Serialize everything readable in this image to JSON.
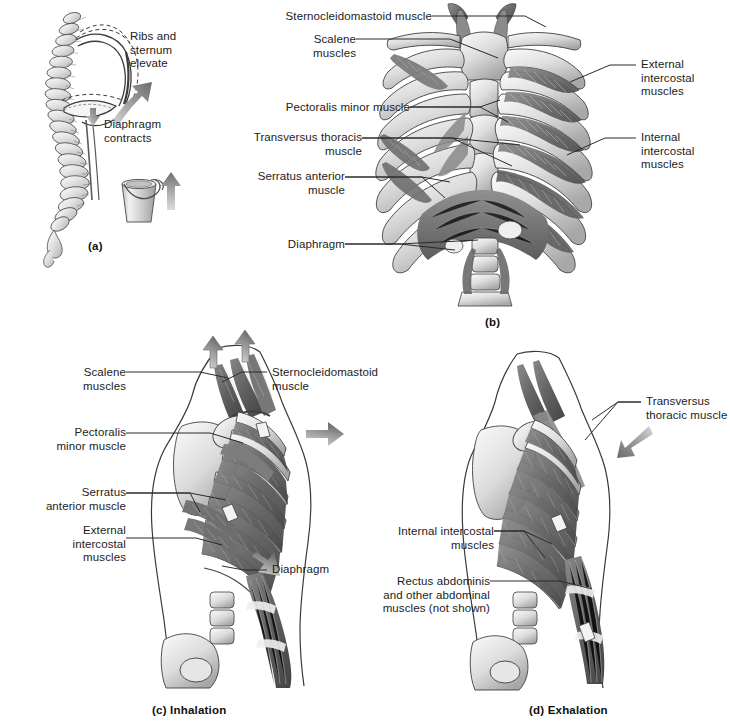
{
  "figure": {
    "background_color": "#ffffff",
    "ink_color": "#1c1c1c",
    "leader_color": "#2a2a2a",
    "arrow_color": "#8a8a8a"
  },
  "panels": [
    {
      "id": "a",
      "caption": "(a)",
      "caption_x": 88,
      "caption_y": 240,
      "subject": "lateral view of vertebral column and rib cage with bucket-handle analogy",
      "labels": [
        {
          "name": "ribs-and-sternum-elevate",
          "text": "Ribs and\nsternum\nelevate",
          "x": 130,
          "y": 30,
          "align": "left"
        },
        {
          "name": "diaphragm-contracts",
          "text": "Diaphragm\ncontracts",
          "x": 104,
          "y": 118,
          "align": "left"
        }
      ],
      "arrows": [
        {
          "name": "elevate-arrow",
          "direction": "up-right"
        },
        {
          "name": "contract-arrow",
          "direction": "down"
        },
        {
          "name": "bucket-handle-arrow",
          "direction": "up"
        }
      ]
    },
    {
      "id": "b",
      "caption": "(b)",
      "caption_x": 485,
      "caption_y": 316,
      "subject": "anterior view of thoracic cage with respiratory muscles",
      "labels": [
        {
          "name": "sternocleidomastoid-muscle",
          "text": "Sternocleidomastoid muscle",
          "x": 268,
          "y": 10,
          "align": "right"
        },
        {
          "name": "scalene-muscles",
          "text": "Scalene muscles",
          "x": 268,
          "y": 33,
          "align": "right"
        },
        {
          "name": "pectoralis-minor-muscle",
          "text": "Pectoralis minor muscle",
          "x": 238,
          "y": 101,
          "align": "right"
        },
        {
          "name": "transversus-thoracis-muscle",
          "text": "Transversus thoracis\nmuscle",
          "x": 238,
          "y": 131,
          "align": "right"
        },
        {
          "name": "serratus-anterior-muscle",
          "text": "Serratus anterior\nmuscle",
          "x": 238,
          "y": 170,
          "align": "right"
        },
        {
          "name": "diaphragm",
          "text": "Diaphragm",
          "x": 238,
          "y": 238,
          "align": "right"
        },
        {
          "name": "external-intercostal-muscles",
          "text": "External\nintercostal\nmuscles",
          "x": 641,
          "y": 58,
          "align": "left"
        },
        {
          "name": "internal-intercostal-muscles",
          "text": "Internal\nintercostal\nmuscles",
          "x": 641,
          "y": 131,
          "align": "left"
        }
      ]
    },
    {
      "id": "c",
      "caption": "(c) Inhalation",
      "caption_x": 152,
      "caption_y": 704,
      "subject": "lateral view during inhalation showing muscle action",
      "labels": [
        {
          "name": "scalene-muscles",
          "text": "Scalene\nmuscles",
          "x": 121,
          "y": 366,
          "align": "right"
        },
        {
          "name": "pectoralis-minor-muscle",
          "text": "Pectoralis\nminor muscle",
          "x": 121,
          "y": 426,
          "align": "right"
        },
        {
          "name": "serratus-anterior-muscle",
          "text": "Serratus\nanterior muscle",
          "x": 121,
          "y": 486,
          "align": "right"
        },
        {
          "name": "external-intercostal-muscles",
          "text": "External\nintercostal\nmuscles",
          "x": 121,
          "y": 524,
          "align": "right"
        },
        {
          "name": "sternocleidomastoid-muscle",
          "text": "Sternocleidomastoid\nmuscle",
          "x": 272,
          "y": 366,
          "align": "left"
        },
        {
          "name": "diaphragm",
          "text": "Diaphragm",
          "x": 272,
          "y": 563,
          "align": "left"
        }
      ],
      "arrows": [
        {
          "name": "scalene-elevation-arrow-left",
          "direction": "up"
        },
        {
          "name": "scalene-elevation-arrow-right",
          "direction": "up"
        },
        {
          "name": "chest-expansion-arrow",
          "direction": "right"
        },
        {
          "name": "diaphragm-descent-arrow",
          "direction": "down-right"
        }
      ]
    },
    {
      "id": "d",
      "caption": "(d) Exhalation",
      "caption_x": 529,
      "caption_y": 704,
      "subject": "lateral view during exhalation showing muscle action",
      "labels": [
        {
          "name": "transversus-thoracis-muscle",
          "text": "Transversus\nthoracic muscle",
          "x": 646,
          "y": 395,
          "align": "left"
        },
        {
          "name": "internal-intercostal-muscles",
          "text": "Internal intercostal\nmuscles",
          "x": 370,
          "y": 525,
          "align": "right"
        },
        {
          "name": "rectus-abdominis-muscles",
          "text": "Rectus abdominis\nand other abdominal\nmuscles (not shown)",
          "x": 370,
          "y": 575,
          "align": "right"
        }
      ],
      "arrows": [
        {
          "name": "chest-compression-arrow",
          "direction": "down-left"
        }
      ]
    }
  ]
}
